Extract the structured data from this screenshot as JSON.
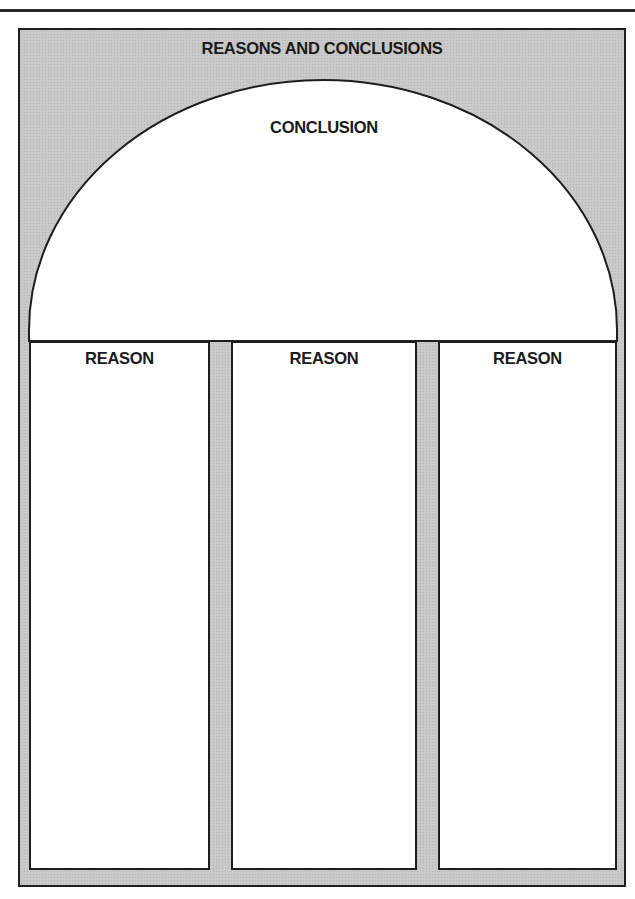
{
  "diagram": {
    "title": "REASONS AND CONCLUSIONS",
    "conclusion": {
      "label": "CONCLUSION"
    },
    "reasons": [
      {
        "label": "REASON"
      },
      {
        "label": "REASON"
      },
      {
        "label": "REASON"
      }
    ],
    "colors": {
      "background_fill": "#c9c9c9",
      "box_fill": "#ffffff",
      "stroke": "#1e1e1e"
    }
  }
}
